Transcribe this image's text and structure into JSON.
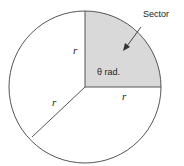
{
  "diagram": {
    "circle": {
      "cx": 85,
      "cy": 87,
      "r": 76,
      "stroke": "#555555",
      "fill": "#ffffff"
    },
    "sector": {
      "fill": "#d9d9d9",
      "angle_label": "θ rad."
    },
    "radius_label": "r",
    "radius_labels": [
      {
        "text": "r",
        "position": "vertical-radius"
      },
      {
        "text": "r",
        "position": "diagonal-radius"
      },
      {
        "text": "r",
        "position": "horizontal-radius"
      }
    ],
    "callout": {
      "text": "Sector"
    }
  }
}
